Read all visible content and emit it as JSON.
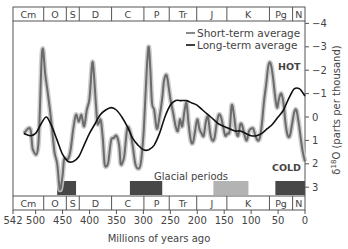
{
  "chart_data": {
    "type": "line",
    "title": "",
    "xlabel": "Millions of years ago",
    "ylabel": "δ18O (parts per thousand)",
    "xlim": [
      542,
      0
    ],
    "ylim": [
      3,
      -4
    ],
    "y_inverted": true,
    "x_ticks": [
      542,
      500,
      450,
      400,
      350,
      300,
      250,
      200,
      150,
      100,
      50,
      0
    ],
    "y_ticks": [
      -4,
      -3,
      -2,
      -1,
      0,
      1,
      2,
      3
    ],
    "legend": {
      "position": "upper right",
      "entries": [
        "Short-term average",
        "Long-term average"
      ]
    },
    "annotations": [
      "HOT",
      "COLD",
      "Glacial periods"
    ],
    "geologic_periods": [
      {
        "label": "Cm",
        "start": 542,
        "end": 485
      },
      {
        "label": "O",
        "start": 485,
        "end": 443
      },
      {
        "label": "S",
        "start": 443,
        "end": 419
      },
      {
        "label": "D",
        "start": 419,
        "end": 359
      },
      {
        "label": "C",
        "start": 359,
        "end": 299
      },
      {
        "label": "P",
        "start": 299,
        "end": 252
      },
      {
        "label": "Tr",
        "start": 252,
        "end": 201
      },
      {
        "label": "J",
        "start": 201,
        "end": 145
      },
      {
        "label": "K",
        "start": 145,
        "end": 66
      },
      {
        "label": "Pg",
        "start": 66,
        "end": 23
      },
      {
        "label": "N",
        "start": 23,
        "end": 0
      }
    ],
    "glacial_periods": [
      {
        "start": 460,
        "end": 425,
        "shade": "dark"
      },
      {
        "start": 325,
        "end": 265,
        "shade": "dark"
      },
      {
        "start": 170,
        "end": 105,
        "shade": "light"
      },
      {
        "start": 55,
        "end": 0,
        "shade": "dark"
      }
    ],
    "series": [
      {
        "name": "Short-term average",
        "x": [
          522,
          510,
          505,
          495,
          488,
          482,
          475,
          470,
          465,
          460,
          455,
          450,
          447,
          440,
          435,
          430,
          425,
          420,
          415,
          410,
          405,
          400,
          395,
          392,
          388,
          385,
          380,
          378,
          375,
          372,
          368,
          365,
          360,
          355,
          350,
          345,
          342,
          338,
          335,
          330,
          325,
          320,
          315,
          310,
          305,
          300,
          297,
          293,
          290,
          287,
          284,
          280,
          275,
          270,
          265,
          262,
          258,
          255,
          250,
          245,
          240,
          236,
          232,
          228,
          224,
          220,
          216,
          212,
          208,
          204,
          200,
          196,
          192,
          188,
          184,
          180,
          176,
          172,
          168,
          164,
          160,
          156,
          152,
          148,
          144,
          140,
          136,
          132,
          128,
          124,
          120,
          116,
          112,
          108,
          104,
          100,
          96,
          92,
          88,
          84,
          80,
          76,
          72,
          68,
          64,
          60,
          56,
          52,
          48,
          44,
          40,
          36,
          32,
          28,
          24,
          20,
          16,
          12,
          8,
          4,
          0
        ],
        "values": [
          0.7,
          0.5,
          1.4,
          1.2,
          -2.8,
          -1.8,
          -0.6,
          0.4,
          1.5,
          2.0,
          3.1,
          2.5,
          1.8,
          1.8,
          1.4,
          0.5,
          -0.1,
          0.2,
          -0.1,
          0.4,
          -0.3,
          -0.8,
          -2.3,
          -1.9,
          -0.5,
          0.3,
          0.1,
          0.3,
          1.0,
          2.0,
          2.1,
          1.9,
          1.0,
          0.9,
          0.8,
          1.2,
          2.0,
          1.9,
          1.6,
          0.5,
          0.6,
          1.2,
          2.0,
          2.2,
          2.0,
          0.8,
          -0.5,
          -2.3,
          -3.0,
          -2.0,
          -0.6,
          -0.3,
          0.5,
          0.0,
          -0.8,
          -1.5,
          -1.8,
          -1.6,
          -0.8,
          -0.2,
          0.4,
          0.6,
          0.1,
          0.4,
          -0.2,
          -0.6,
          0.3,
          1.0,
          1.1,
          0.6,
          0.1,
          0.5,
          0.7,
          0.8,
          0.2,
          0.0,
          0.7,
          1.0,
          0.9,
          0.3,
          -0.1,
          0.0,
          0.4,
          0.8,
          0.7,
          0.6,
          -0.5,
          -0.1,
          0.6,
          0.8,
          0.3,
          0.4,
          0.8,
          1.0,
          0.6,
          0.5,
          0.5,
          0.8,
          1.0,
          0.9,
          0.3,
          -0.7,
          -1.4,
          -2.2,
          -2.3,
          -1.8,
          -1.0,
          -0.4,
          -0.8,
          -1.0,
          -0.6,
          0.3,
          0.8,
          0.8,
          0.3,
          -0.2,
          -0.3,
          0.2,
          0.9,
          1.5,
          1.9
        ],
        "color": "#6b6b6b",
        "band_color": "#c8c8c8"
      },
      {
        "name": "Long-term average",
        "x": [
          522,
          510,
          500,
          490,
          480,
          470,
          460,
          450,
          440,
          430,
          420,
          410,
          400,
          390,
          380,
          370,
          360,
          350,
          340,
          330,
          320,
          310,
          300,
          290,
          280,
          270,
          260,
          250,
          240,
          230,
          220,
          210,
          200,
          190,
          180,
          170,
          160,
          150,
          140,
          130,
          120,
          110,
          100,
          90,
          80,
          70,
          60,
          50,
          40,
          30,
          20,
          10,
          0
        ],
        "values": [
          0.7,
          0.8,
          0.7,
          0.3,
          0.0,
          0.4,
          1.0,
          1.6,
          1.9,
          1.9,
          1.7,
          1.2,
          0.7,
          0.3,
          -0.1,
          -0.3,
          -0.4,
          -0.3,
          0.0,
          0.4,
          0.9,
          1.2,
          1.4,
          1.4,
          1.2,
          0.7,
          0.0,
          -0.5,
          -0.7,
          -0.7,
          -0.7,
          -0.6,
          -0.5,
          -0.3,
          -0.1,
          0.1,
          0.3,
          0.4,
          0.5,
          0.6,
          0.6,
          0.7,
          0.8,
          0.8,
          0.7,
          0.5,
          0.3,
          0.0,
          -0.3,
          -0.8,
          -1.2,
          -1.2,
          -0.9
        ],
        "color": "#111111"
      }
    ]
  },
  "labels": {
    "hot": "HOT",
    "cold": "COLD",
    "glacial": "Glacial periods",
    "xlabel": "Millions of years ago",
    "ylabel_prefix": "δ",
    "ylabel_sup": "18",
    "ylabel_suffix": "O (parts per thousand)",
    "legend_short": "Short-term average",
    "legend_long": "Long-term average"
  }
}
